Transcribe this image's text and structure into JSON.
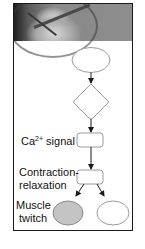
{
  "figure": {
    "header_image": "grayscale-compass-clock-photo",
    "nodes": [
      {
        "id": "start",
        "shape": "oval",
        "fill": "#ffffff",
        "label": ""
      },
      {
        "id": "decision",
        "shape": "diamond",
        "fill": "#ffffff",
        "label": ""
      },
      {
        "id": "ca_signal",
        "shape": "rounded-rect",
        "fill": "#ffffff",
        "label": ""
      },
      {
        "id": "contraction",
        "shape": "rounded-rect",
        "fill": "#ffffff",
        "label": ""
      },
      {
        "id": "twitch_a",
        "shape": "oval",
        "fill": "#c4c4c4",
        "label": ""
      },
      {
        "id": "twitch_b",
        "shape": "oval",
        "fill": "#ffffff",
        "label": ""
      }
    ],
    "edges": [
      {
        "from": "start",
        "to": "decision"
      },
      {
        "from": "decision",
        "to": "ca_signal"
      },
      {
        "from": "ca_signal",
        "to": "contraction"
      },
      {
        "from": "contraction",
        "to": "twitch_a"
      },
      {
        "from": "contraction",
        "to": "twitch_b"
      }
    ],
    "labels": {
      "ca_prefix": "Ca",
      "ca_superscript": "2+",
      "ca_suffix": " signal",
      "contraction_line1": "Contraction-",
      "contraction_line2": "relaxation",
      "muscle_line1": "Muscle",
      "muscle_line2": "twitch"
    },
    "colors": {
      "stroke": "#9a9a9a",
      "arrow": "#1a1a1a",
      "frame": "#1a1a1a",
      "gray_fill": "#c4c4c4"
    }
  }
}
